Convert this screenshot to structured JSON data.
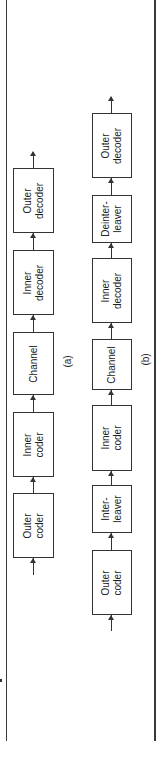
{
  "figure": {
    "orientation": "rotated-90-ccw",
    "diagrams": [
      {
        "id": "a",
        "caption": "(a)",
        "blocks": [
          {
            "label": "Outer\ncoder",
            "top": 493,
            "bottom": 558
          },
          {
            "label": "Inner\ncoder",
            "top": 412,
            "bottom": 477
          },
          {
            "label": "Channel",
            "top": 332,
            "bottom": 395
          },
          {
            "label": "Inner\ndecoder",
            "top": 250,
            "bottom": 315
          },
          {
            "label": "Outer\ndecoder",
            "top": 168,
            "bottom": 233
          }
        ]
      },
      {
        "id": "b",
        "caption": "(b)",
        "blocks": [
          {
            "label": "Outer\ncoder",
            "top": 550,
            "bottom": 615
          },
          {
            "label": "Inter-\nleaver",
            "top": 485,
            "bottom": 533
          },
          {
            "label": "Inner\ncoder",
            "top": 405,
            "bottom": 471
          },
          {
            "label": "Channel",
            "top": 339,
            "bottom": 390
          },
          {
            "label": "Inner\ndecoder",
            "top": 258,
            "bottom": 323
          },
          {
            "label": "Deinter-\nleaver",
            "top": 195,
            "bottom": 243
          },
          {
            "label": "Outer\ndecoder",
            "top": 113,
            "bottom": 178
          }
        ]
      }
    ]
  },
  "labels": {
    "a": {
      "outer_coder": "Outer\ncoder",
      "inner_coder": "Inner\ncoder",
      "channel": "Channel",
      "inner_decoder": "Inner\ndecoder",
      "outer_decoder": "Outer\ndecoder",
      "caption": "(a)"
    },
    "b": {
      "outer_coder": "Outer\ncoder",
      "interleaver": "Inter-\nleaver",
      "inner_coder": "Inner\ncoder",
      "channel": "Channel",
      "inner_decoder": "Inner\ndecoder",
      "deinterleaver": "Deinter-\nleaver",
      "outer_decoder": "Outer\ndecoder",
      "caption": "(b)"
    }
  }
}
